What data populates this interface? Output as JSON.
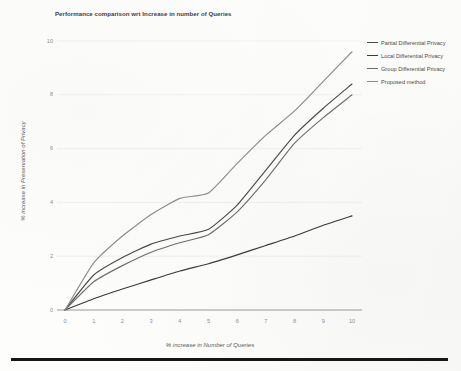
{
  "chart_data": {
    "type": "line",
    "title": "Performance comparison wrt Increase in number of Queries",
    "xlabel": "% increase in Number of Queries",
    "ylabel": "% increase in Preservation of Privacy",
    "xlim": [
      0,
      10
    ],
    "ylim": [
      0,
      10
    ],
    "xticks": [
      0,
      1,
      2,
      3,
      4,
      5,
      6,
      7,
      8,
      9,
      10
    ],
    "yticks": [
      0,
      2,
      4,
      6,
      8,
      10
    ],
    "grid": "horizontal",
    "legend_position": "top-right",
    "x": [
      0,
      1,
      2,
      3,
      4,
      5,
      6,
      7,
      8,
      9,
      10
    ],
    "series": [
      {
        "name": "Partial Differential Privacy",
        "color": "#4a4a4a",
        "values": [
          0,
          1.3,
          1.95,
          2.45,
          2.75,
          3.0,
          3.9,
          5.2,
          6.5,
          7.5,
          8.4
        ]
      },
      {
        "name": "Local Differential Privacy",
        "color": "#3a3a3a",
        "values": [
          0,
          0.42,
          0.78,
          1.12,
          1.45,
          1.72,
          2.05,
          2.4,
          2.75,
          3.15,
          3.5
        ]
      },
      {
        "name": "Group Differential Privacy",
        "color": "#6e6e6e",
        "values": [
          0,
          1.05,
          1.65,
          2.15,
          2.5,
          2.8,
          3.65,
          4.85,
          6.2,
          7.15,
          8.0
        ]
      },
      {
        "name": "Proposed method",
        "color": "#8c8c8c",
        "values": [
          0,
          1.75,
          2.75,
          3.55,
          4.15,
          4.35,
          5.45,
          6.5,
          7.4,
          8.5,
          9.6
        ]
      }
    ]
  },
  "axis": {
    "y_tick_labels": [
      "0",
      "2",
      "4",
      "6",
      "8",
      "10"
    ],
    "x_tick_labels": [
      "0",
      "1",
      "2",
      "3",
      "4",
      "5",
      "6",
      "7",
      "8",
      "9",
      "10"
    ]
  },
  "colors": {
    "gridline": "#e9e9e9",
    "axis": "#9a9a9a",
    "page_bar": "#161616"
  }
}
